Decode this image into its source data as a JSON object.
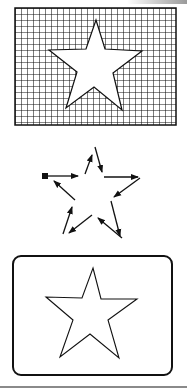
{
  "figure": {
    "panels": [
      {
        "name": "grid-filled-star",
        "description": "Rectangle filled with a square grid, star shape left unfilled (white)",
        "rect": {
          "x": 15,
          "y": 8,
          "w": 161,
          "h": 117
        },
        "grid_cell": 6,
        "star": [
          [
            96,
            20
          ],
          [
            105,
            49
          ],
          [
            142,
            51
          ],
          [
            113,
            73
          ],
          [
            122,
            110
          ],
          [
            94,
            87
          ],
          [
            66,
            108
          ],
          [
            77,
            72
          ],
          [
            49,
            50
          ],
          [
            86,
            49
          ]
        ]
      },
      {
        "name": "arrow-traced-star",
        "description": "Star outline traced by directional arrows starting from a filled square",
        "start_marker": [
          45,
          176
        ],
        "arrows": [
          [
            [
              47,
              176
            ],
            [
              78,
              176
            ]
          ],
          [
            [
              85,
              174
            ],
            [
              92,
              155
            ]
          ],
          [
            [
              95,
              147
            ],
            [
              102,
              172
            ]
          ],
          [
            [
              104,
              177
            ],
            [
              138,
              177
            ]
          ],
          [
            [
              140,
              178
            ],
            [
              114,
              197
            ]
          ],
          [
            [
              111,
              201
            ],
            [
              120,
              236
            ]
          ],
          [
            [
              122,
              238
            ],
            [
              98,
              218
            ]
          ],
          [
            [
              92,
              215
            ],
            [
              69,
              233
            ]
          ],
          [
            [
              63,
              234
            ],
            [
              72,
              207
            ]
          ],
          [
            [
              75,
              200
            ],
            [
              54,
              181
            ]
          ]
        ]
      },
      {
        "name": "boxed-star-outline",
        "description": "Rounded rectangle frame containing an outlined star",
        "rect": {
          "x": 13,
          "y": 256,
          "w": 159,
          "h": 119,
          "r": 8
        },
        "star": [
          [
            93,
            268
          ],
          [
            101,
            299
          ],
          [
            137,
            299
          ],
          [
            108,
            320
          ],
          [
            119,
            358
          ],
          [
            90,
            334
          ],
          [
            60,
            357
          ],
          [
            73,
            320
          ],
          [
            46,
            297
          ],
          [
            82,
            298
          ]
        ]
      }
    ],
    "colors": {
      "stroke": "#111111",
      "background": "#ffffff",
      "rule": "#8a8a8a"
    }
  }
}
